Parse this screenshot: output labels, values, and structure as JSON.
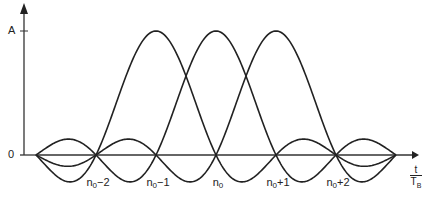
{
  "chart_data": {
    "type": "line",
    "title": "",
    "xlabel": "t/T_B",
    "ylabel": "",
    "y_ticks": [
      "0",
      "A"
    ],
    "x_ticks": [
      "n0-2",
      "n0-1",
      "n0",
      "n0+1",
      "n0+2"
    ],
    "x_tick_positions": [
      -2,
      -1,
      0,
      1,
      2
    ],
    "xlim": [
      -3,
      3
    ],
    "ylim": [
      -0.22,
      1
    ],
    "series": [
      {
        "name": "pulse n0-1",
        "function": "A*sinc(t/T_B - (n0-1))",
        "center": -1,
        "peak": 1
      },
      {
        "name": "pulse n0",
        "function": "A*sinc(t/T_B - n0)",
        "center": 0,
        "peak": 1
      },
      {
        "name": "pulse n0+1",
        "function": "A*sinc(t/T_B - (n0+1))",
        "center": 1,
        "peak": 1
      }
    ],
    "grid": false,
    "legend": "none"
  },
  "labels": {
    "y_zero": "0",
    "y_A": "A",
    "x_ticks": [
      {
        "base": "n",
        "sub": "0",
        "suffix": "−2"
      },
      {
        "base": "n",
        "sub": "0",
        "suffix": "−1"
      },
      {
        "base": "n",
        "sub": "0",
        "suffix": ""
      },
      {
        "base": "n",
        "sub": "0",
        "suffix": "+1"
      },
      {
        "base": "n",
        "sub": "0",
        "suffix": "+2"
      }
    ],
    "x_axis_num": "t",
    "x_axis_den": "T",
    "x_axis_den_sub": "B"
  },
  "colors": {
    "line": "#222222",
    "axis": "#333333"
  }
}
